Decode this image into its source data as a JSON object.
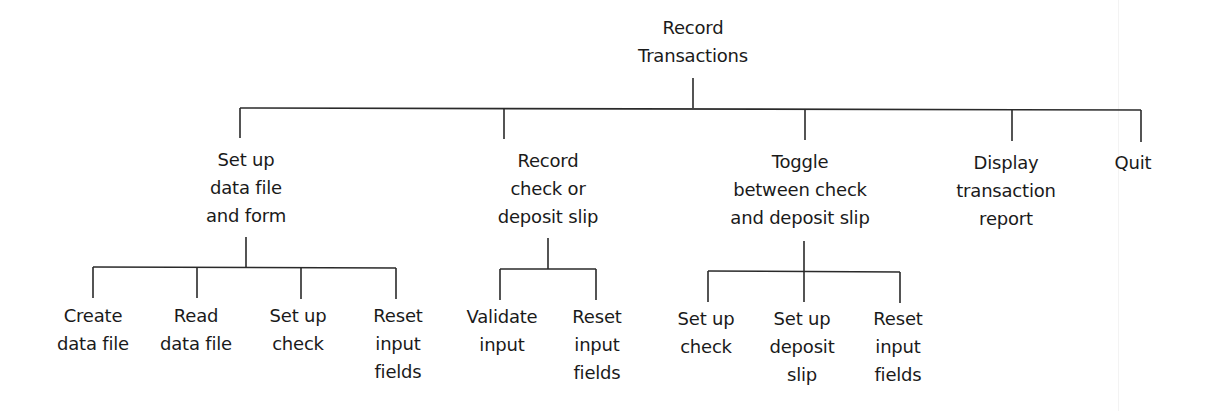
{
  "diagram": {
    "type": "hierarchy-chart",
    "line_color": "#2a2a2a",
    "root": {
      "lines": [
        "Record",
        "Transactions"
      ]
    },
    "level1": [
      {
        "lines": [
          "Set up",
          "data file",
          "and form"
        ],
        "children": [
          {
            "lines": [
              "Create",
              "data file"
            ]
          },
          {
            "lines": [
              "Read",
              "data file"
            ]
          },
          {
            "lines": [
              "Set up",
              "check"
            ]
          },
          {
            "lines": [
              "Reset",
              "input",
              "fields"
            ]
          }
        ]
      },
      {
        "lines": [
          "Record",
          "check or",
          "deposit slip"
        ],
        "children": [
          {
            "lines": [
              "Validate",
              "input"
            ]
          },
          {
            "lines": [
              "Reset",
              "input",
              "fields"
            ]
          }
        ]
      },
      {
        "lines": [
          "Toggle",
          "between check",
          "and deposit slip"
        ],
        "children": [
          {
            "lines": [
              "Set up",
              "check"
            ]
          },
          {
            "lines": [
              "Set up",
              "deposit",
              "slip"
            ]
          },
          {
            "lines": [
              "Reset",
              "input",
              "fields"
            ]
          }
        ]
      },
      {
        "lines": [
          "Display",
          "transaction",
          "report"
        ],
        "children": []
      },
      {
        "lines": [
          "Quit"
        ],
        "children": []
      }
    ]
  }
}
